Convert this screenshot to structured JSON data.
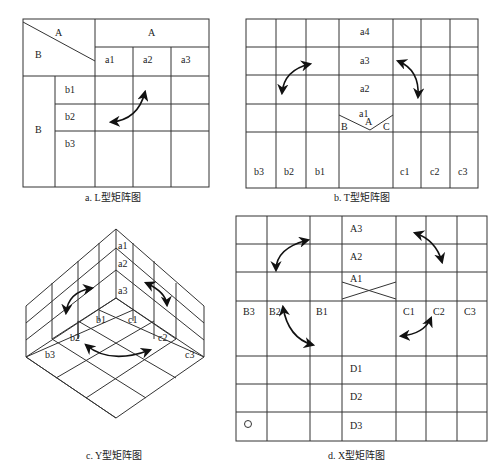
{
  "diagrams": {
    "L": {
      "caption": "a. L型矩阵图",
      "corner_top": "A",
      "corner_bottom": "B",
      "header_A": "A",
      "cols": [
        "a1",
        "a2",
        "a3"
      ],
      "row_group": "B",
      "rows": [
        "b1",
        "b2",
        "b3"
      ]
    },
    "T": {
      "caption": "b. T型矩阵图",
      "a_rows": [
        "a4",
        "a3",
        "a2",
        "a1"
      ],
      "b_cols": [
        "b3",
        "b2",
        "b1"
      ],
      "c_cols": [
        "c1",
        "c2",
        "c3"
      ],
      "hub": {
        "A": "A",
        "B": "B",
        "C": "C"
      }
    },
    "Y": {
      "caption": "c. Y型矩阵图",
      "a_labels": [
        "a1",
        "a2",
        "a3"
      ],
      "b_labels": [
        "b1",
        "b2",
        "b3"
      ],
      "c_labels": [
        "c1",
        "c2",
        "c3"
      ]
    },
    "X": {
      "caption": "d. X型矩阵图",
      "a_rows": [
        "A3",
        "A2",
        "A1"
      ],
      "b_cols": [
        "B3",
        "B2",
        "B1"
      ],
      "c_cols": [
        "C1",
        "C2",
        "C3"
      ],
      "d_rows": [
        "D1",
        "D2",
        "D3"
      ],
      "marker": "○"
    }
  }
}
